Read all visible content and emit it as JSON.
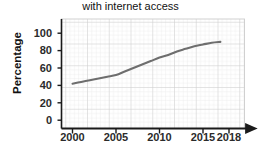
{
  "chart_data": {
    "type": "line",
    "title": "with internet access",
    "xlabel": "",
    "ylabel": "Percentage",
    "grid": true,
    "legend": null,
    "xlim": [
      1998,
      2019.5
    ],
    "ylim": [
      0,
      115
    ],
    "xticks": [
      "2000",
      "2005",
      "2010",
      "2015",
      "2018"
    ],
    "xtick_values": [
      2000,
      2005,
      2010,
      2015,
      2018
    ],
    "yticks": [
      "0",
      "20",
      "40",
      "60",
      "80",
      "100"
    ],
    "ytick_values": [
      0,
      20,
      40,
      60,
      80,
      100
    ],
    "x": [
      2000,
      2001,
      2002,
      2003,
      2004,
      2005,
      2006,
      2007,
      2008,
      2009,
      2010,
      2011,
      2012,
      2013,
      2014,
      2015,
      2016,
      2017
    ],
    "values": [
      42,
      44,
      46,
      48,
      50,
      52,
      56,
      60,
      64,
      68,
      72,
      75,
      79,
      82,
      85,
      87,
      89,
      90
    ],
    "series": [
      {
        "name": "Percentage with internet access",
        "color": "#6e6e6e",
        "values": [
          42,
          44,
          46,
          48,
          50,
          52,
          56,
          60,
          64,
          68,
          72,
          75,
          79,
          82,
          85,
          87,
          89,
          90
        ]
      }
    ],
    "annotations": []
  },
  "axes": {
    "y_label": "Percentage",
    "y_ticks": [
      {
        "label": "100",
        "value": 100
      },
      {
        "label": "80",
        "value": 80
      },
      {
        "label": "60",
        "value": 60
      },
      {
        "label": "40",
        "value": 40
      },
      {
        "label": "20",
        "value": 20
      },
      {
        "label": "0",
        "value": 0
      }
    ],
    "x_ticks": [
      {
        "label": "2000",
        "value": 2000
      },
      {
        "label": "2005",
        "value": 2005
      },
      {
        "label": "2010",
        "value": 2010
      },
      {
        "label": "2015",
        "value": 2015
      },
      {
        "label": "2018",
        "value": 2018
      }
    ]
  },
  "colors": {
    "line": "#6e6e6e",
    "axis": "#1a1a1a",
    "grid_minor": "#e3e3e3",
    "grid_major": "#cfcfcf",
    "text": "#1f1f1f",
    "background": "#ffffff"
  }
}
